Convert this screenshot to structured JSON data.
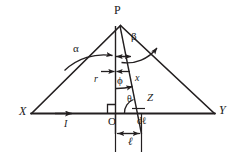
{
  "figure": {
    "type": "geometry-diagram",
    "background_color": "#ffffff",
    "line_color": "#231f20",
    "points": {
      "P": {
        "label": "P",
        "x": 120,
        "y": 20,
        "style": "upright",
        "role": "field-point-apex"
      },
      "X": {
        "label": "X",
        "x": 22,
        "y": 114,
        "style": "italic",
        "role": "wire-left-end"
      },
      "Y": {
        "label": "Y",
        "x": 221,
        "y": 113,
        "style": "italic",
        "role": "wire-right-end"
      },
      "O": {
        "label": "O",
        "x": 112,
        "y": 122,
        "style": "upright",
        "role": "foot-of-perpendicular"
      },
      "Z": {
        "label": "Z",
        "x": 150,
        "y": 99,
        "style": "italic",
        "role": "source-element-point"
      }
    },
    "segments": {
      "r": {
        "label": "r",
        "x": 96,
        "y": 80,
        "style": "italic",
        "role": "perpendicular-distance-P-to-O"
      },
      "x": {
        "label": "x",
        "x": 138,
        "y": 80,
        "style": "italic",
        "role": "distance-P-to-Z"
      },
      "dl": {
        "label": "dℓ",
        "x": 141,
        "y": 122,
        "style": "upright-italic",
        "role": "current-element-length"
      },
      "l": {
        "label": "ℓ",
        "x": 132,
        "y": 143,
        "style": "italic",
        "role": "distance-O-to-Z"
      },
      "I": {
        "label": "I",
        "x": 66,
        "y": 126,
        "style": "italic",
        "role": "current-direction"
      }
    },
    "angles": {
      "alpha": {
        "label": "α",
        "x": 76,
        "y": 50,
        "role": "angle-at-P-between-PX-and-PO"
      },
      "beta": {
        "label": "β",
        "x": 135,
        "y": 39,
        "role": "angle-at-P-between-PO-and-PY"
      },
      "phi": {
        "label": "ϕ",
        "x": 119,
        "y": 83,
        "role": "angle-at-P-between-PO-and-PZ"
      },
      "theta": {
        "label": "θ",
        "x": 130,
        "y": 101,
        "role": "angle-at-Z-between-wire-and-ZP"
      }
    },
    "markers": {
      "right_angle_at_O": {
        "name": "right-angle-marker",
        "x": 109,
        "y": 104
      }
    }
  }
}
